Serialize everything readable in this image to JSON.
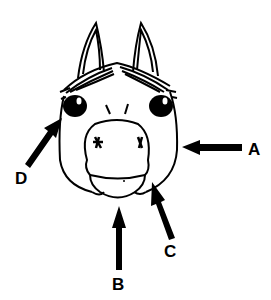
{
  "diagram": {
    "colors": {
      "ink": "#000000",
      "background": "#ffffff"
    },
    "labels": [
      {
        "id": "A",
        "text": "A",
        "x": 248,
        "y": 155,
        "points_to": "cheek / jaw (right side)"
      },
      {
        "id": "B",
        "text": "B",
        "x": 112,
        "y": 290,
        "points_to": "chin / lower lip"
      },
      {
        "id": "C",
        "text": "C",
        "x": 164,
        "y": 257,
        "points_to": "jaw edge (lower right)"
      },
      {
        "id": "D",
        "text": "D",
        "x": 15,
        "y": 184,
        "points_to": "cheek (left side) below eye"
      }
    ]
  }
}
